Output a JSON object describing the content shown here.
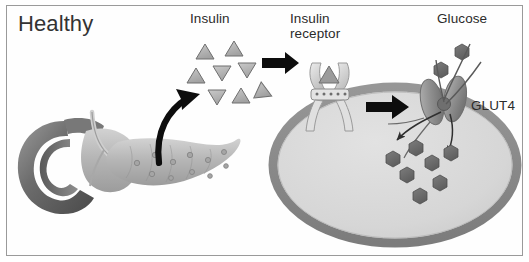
{
  "figure": {
    "title": "Healthy",
    "width": 529,
    "height": 262,
    "background": "#ffffff",
    "frame_color": "#9a9a9a"
  },
  "labels": {
    "title": "Healthy",
    "insulin": "Insulin",
    "insulin_receptor": "Insulin\nreceptor",
    "glucose": "Glucose",
    "glut4": "GLUT4"
  },
  "colors": {
    "text": "#2b2b2b",
    "arrow_black": "#0d0d0d",
    "insulin_triangle_fill": "#b4b4b4",
    "insulin_triangle_stroke": "#6f6f6f",
    "cell_membrane": "#8a8a8a",
    "cell_interior": "#d9d9d9",
    "glucose_hexagon": "#6d6d6d",
    "receptor_fill": "#d2d2d2",
    "glut4_fill": "#9a9a9a",
    "pancreas_body": "#b9b9b9",
    "duodenum": "#6a6a6a"
  },
  "organs": {
    "pancreas": {
      "name": "pancreas-illustration",
      "parts": [
        "duodenum",
        "pancreas-head",
        "pancreas-body",
        "pancreas-tail",
        "islets-of-langerhans"
      ],
      "islet_count": 11
    },
    "cell": {
      "name": "muscle-fat-cell",
      "shape": "ellipse",
      "membrane_thickness_px": 9
    }
  },
  "molecules": {
    "insulin": {
      "shape": "triangle",
      "count": 8,
      "positions": [
        {
          "x": 205,
          "y": 52,
          "rot": 0
        },
        {
          "x": 234,
          "y": 48,
          "rot": 0
        },
        {
          "x": 196,
          "y": 76,
          "rot": 8
        },
        {
          "x": 222,
          "y": 73,
          "rot": 180
        },
        {
          "x": 247,
          "y": 70,
          "rot": 180
        },
        {
          "x": 217,
          "y": 97,
          "rot": 180
        },
        {
          "x": 241,
          "y": 95,
          "rot": 0
        },
        {
          "x": 258,
          "y": 88,
          "rot": 180
        }
      ]
    },
    "glucose": {
      "shape": "hexagon",
      "count_inside_cell": 7,
      "count_outside_cell": 2,
      "positions_inside": [
        {
          "x": 393,
          "y": 159
        },
        {
          "x": 416,
          "y": 148
        },
        {
          "x": 407,
          "y": 175
        },
        {
          "x": 432,
          "y": 163
        },
        {
          "x": 447,
          "y": 153
        },
        {
          "x": 438,
          "y": 183
        },
        {
          "x": 420,
          "y": 196
        }
      ],
      "positions_outside": [
        {
          "x": 462,
          "y": 51
        },
        {
          "x": 443,
          "y": 69
        }
      ]
    }
  },
  "arrows": {
    "secretion_arrow": {
      "name": "pancreas-to-insulin-arrow",
      "style": "thick-curved-black",
      "from": "pancreas",
      "to": "insulin-cluster"
    },
    "binding_arrow": {
      "name": "insulin-to-receptor-arrow",
      "style": "straight-block-black",
      "from": "insulin-cluster",
      "to": "insulin-receptor"
    },
    "signal_arrow": {
      "name": "receptor-to-glut4-arrow",
      "style": "straight-block-black",
      "from": "insulin-receptor",
      "to": "glut4-transporter"
    },
    "uptake_arrows": {
      "name": "glucose-uptake-arrows",
      "style": "thin-curved",
      "count": 2
    }
  },
  "structures": {
    "insulin_receptor": {
      "name": "insulin-receptor",
      "description": "Y-shaped transmembrane receptor with bound insulin triangle"
    },
    "glut4": {
      "name": "glut4-transporter",
      "description": "Two barrel subunits embedded in the membrane forming a glucose channel"
    }
  }
}
